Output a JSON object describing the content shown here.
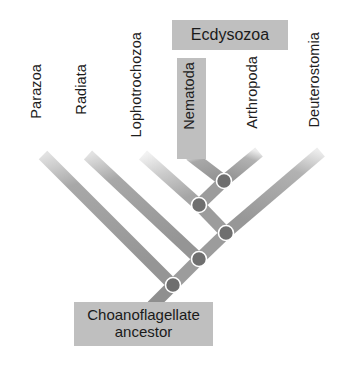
{
  "diagram": {
    "type": "phylogenetic-cladogram",
    "title_visible": false,
    "colors": {
      "branch_dark": "#9a9a9a",
      "branch_light": "#d8d8d8",
      "node_fill": "#707070",
      "node_ring": "#ffffff",
      "label_box": "#bfbfbf",
      "text": "#1a1a1a",
      "background": "#ffffff"
    },
    "taxa": [
      {
        "name": "taxon-parazoa",
        "label": "Parazoa"
      },
      {
        "name": "taxon-radiata",
        "label": "Radiata"
      },
      {
        "name": "taxon-lophotrochozoa",
        "label": "Lophotrochozoa"
      },
      {
        "name": "taxon-nematoda",
        "label": "Nematoda"
      },
      {
        "name": "taxon-arthropoda",
        "label": "Arthropoda"
      },
      {
        "name": "taxon-deuterostomia",
        "label": "Deuterostomia"
      }
    ],
    "clade_labels": [
      {
        "name": "clade-ecdysozoa",
        "label": "Ecdysozoa",
        "covers": [
          "Nematoda",
          "Arthropoda"
        ]
      }
    ],
    "root": {
      "line1": "Choanoflagellate",
      "line2": "ancestor"
    },
    "nodes": [
      {
        "name": "node-ecdysozoa",
        "cx": 224,
        "cy": 181
      },
      {
        "name": "node-lophotrochozoa",
        "cx": 199,
        "cy": 205
      },
      {
        "name": "node-bilateria",
        "cx": 226,
        "cy": 233
      },
      {
        "name": "node-eumetazoa",
        "cx": 199,
        "cy": 259
      },
      {
        "name": "node-root",
        "cx": 173,
        "cy": 285
      }
    ]
  }
}
